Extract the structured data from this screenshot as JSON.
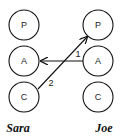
{
  "diagram": {
    "type": "transactional-analysis-ego-states",
    "people": [
      {
        "name": "Sara",
        "states": [
          "P",
          "A",
          "C"
        ]
      },
      {
        "name": "Joe",
        "states": [
          "P",
          "A",
          "C"
        ]
      }
    ],
    "transactions": [
      {
        "label": "1",
        "from": "Joe.A",
        "to": "Sara.A"
      },
      {
        "label": "2",
        "from": "Sara.C",
        "to": "Joe.P"
      }
    ]
  },
  "colors": {
    "line": "#111111",
    "background": "#ffffff"
  }
}
